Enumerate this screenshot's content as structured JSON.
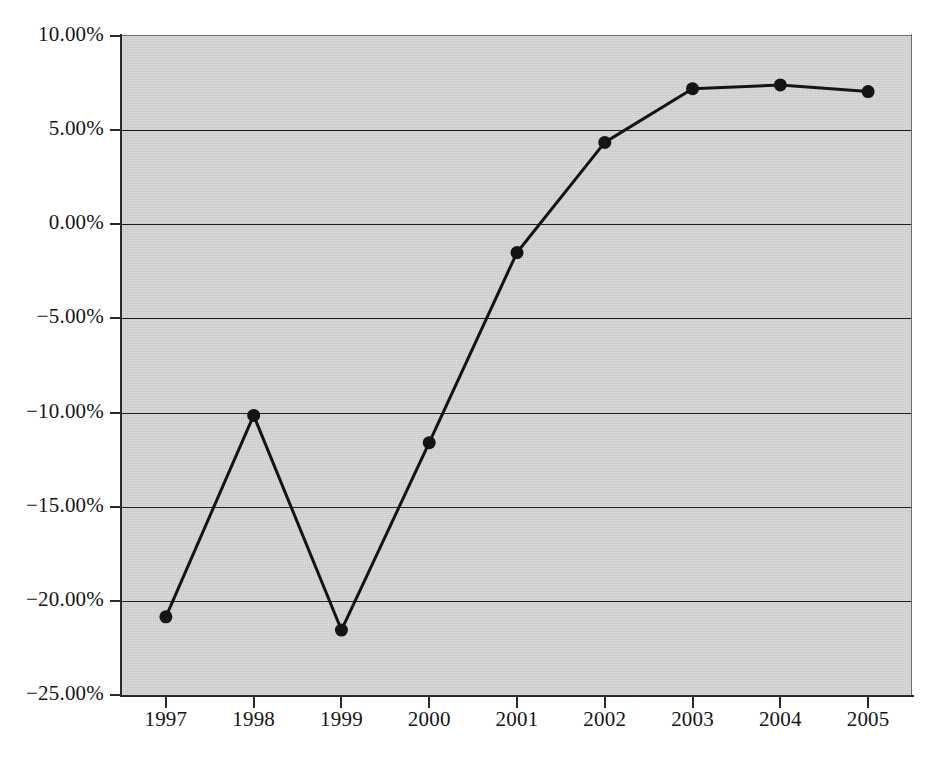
{
  "chart_data": {
    "type": "line",
    "title": "",
    "subtitle": "",
    "xlabel": "",
    "ylabel": "",
    "categories": [
      "1997",
      "1998",
      "1999",
      "2000",
      "2001",
      "2002",
      "2003",
      "2004",
      "2005"
    ],
    "x": [
      1997,
      1998,
      1999,
      2000,
      2001,
      2002,
      2003,
      2004,
      2005
    ],
    "values": [
      -20.85,
      -10.15,
      -21.55,
      -11.6,
      -1.5,
      4.35,
      7.2,
      7.4,
      7.05
    ],
    "series": [
      {
        "name": "",
        "values": [
          -20.85,
          -10.15,
          -21.55,
          -11.6,
          -1.5,
          4.35,
          7.2,
          7.4,
          7.05
        ]
      }
    ],
    "ylim": [
      -25,
      10
    ],
    "xlim": [
      1996.5,
      2005.5
    ],
    "ytick_values": [
      10,
      5,
      0,
      -5,
      -10,
      -15,
      -20,
      -25
    ],
    "ytick_labels": [
      "10.00%",
      "5.00%",
      "0.00%",
      "−5.00%",
      "−10.00%",
      "−15.00%",
      "−20.00%",
      "−25.00%"
    ],
    "xtick_labels": [
      "1997",
      "1998",
      "1999",
      "2000",
      "2001",
      "2002",
      "2003",
      "2004",
      "2005"
    ],
    "grid": true,
    "grid_axis": "y",
    "legend": false,
    "legend_position": "none",
    "marker": "filled-circle",
    "line_color": "#141414",
    "marker_color": "#141414",
    "plot_background_color": "#c9c9c9",
    "figure_background_color": "#ffffff",
    "axis_color": "#2a2a2a",
    "gridline_color": "#1e1e1e",
    "annotations": []
  }
}
